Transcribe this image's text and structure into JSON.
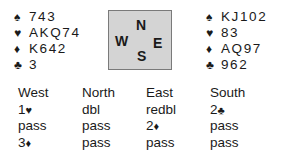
{
  "hands": {
    "west": {
      "spades": "743",
      "hearts": "AKQ74",
      "diamonds": "K642",
      "clubs": "3"
    },
    "east": {
      "spades": "KJ102",
      "hearts": "83",
      "diamonds": "AQ97",
      "clubs": "962"
    }
  },
  "suit_symbols": {
    "spades": "♠",
    "hearts": "♥",
    "diamonds": "♦",
    "clubs": "♣"
  },
  "compass": {
    "north": "N",
    "west": "W",
    "east": "E",
    "south": "S",
    "background": "#d4d4d4"
  },
  "auction": {
    "headers": [
      "West",
      "North",
      "East",
      "South"
    ],
    "rows": [
      [
        {
          "text": "1",
          "suit": "♥"
        },
        {
          "text": "dbl",
          "suit": ""
        },
        {
          "text": "redbl",
          "suit": ""
        },
        {
          "text": "2",
          "suit": "♣"
        }
      ],
      [
        {
          "text": "pass",
          "suit": ""
        },
        {
          "text": "pass",
          "suit": ""
        },
        {
          "text": "2",
          "suit": "♦"
        },
        {
          "text": "pass",
          "suit": ""
        }
      ],
      [
        {
          "text": "3",
          "suit": "♦"
        },
        {
          "text": "pass",
          "suit": ""
        },
        {
          "text": "pass",
          "suit": ""
        },
        {
          "text": "pass",
          "suit": ""
        }
      ]
    ]
  }
}
